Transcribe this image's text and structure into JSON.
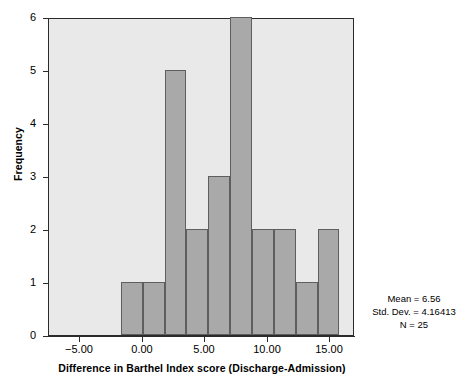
{
  "chart_data": {
    "type": "bar",
    "title": "",
    "xlabel": "Difference in Barthel Index score (Discharge-Admission)",
    "ylabel": "Frequency",
    "xlim": [
      -7.5,
      17.0
    ],
    "ylim": [
      0,
      6
    ],
    "grid": false,
    "legend_position": "none",
    "bin_width": 1.75,
    "bin_starts": [
      -1.75,
      0.0,
      1.75,
      3.5,
      5.25,
      7.0,
      8.75,
      10.5,
      12.25,
      14.0
    ],
    "categories": [
      "-1.75 to 0.00",
      "0.00 to 1.75",
      "1.75 to 3.50",
      "3.50 to 5.25",
      "5.25 to 7.00",
      "7.00 to 8.75",
      "8.75 to 10.50",
      "10.50 to 12.25",
      "12.25 to 14.00",
      "14.00 to 15.75"
    ],
    "values": [
      1,
      1,
      5,
      2,
      3,
      6,
      2,
      2,
      1,
      2
    ],
    "x_ticks": [
      -5.0,
      0.0,
      5.0,
      10.0,
      15.0
    ],
    "x_tick_labels": [
      "-5.00",
      "0.00",
      "5.00",
      "10.00",
      "15.00"
    ],
    "y_ticks": [
      0,
      1,
      2,
      3,
      4,
      5,
      6
    ],
    "y_tick_labels": [
      "0",
      "1",
      "2",
      "3",
      "4",
      "5",
      "6"
    ],
    "annotations": {
      "mean": "Mean = 6.56",
      "std_dev": "Std. Dev. = 4.16413",
      "n": "N = 25"
    },
    "colors": {
      "bar_fill": "#a9a9a9",
      "bar_border": "#5e5e5e",
      "plot_background": "#e9e9e9",
      "axis": "#2b2b2b",
      "text": "#000000",
      "figure_background": "#ffffff"
    }
  }
}
